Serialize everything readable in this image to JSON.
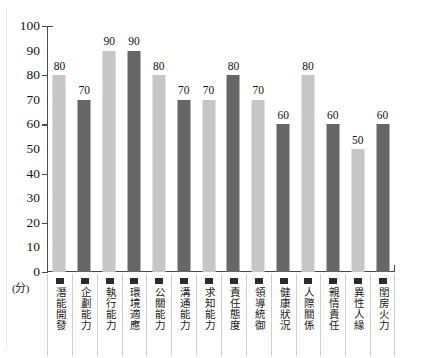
{
  "chart_data": {
    "type": "bar",
    "title": "",
    "xlabel": "",
    "ylabel": "(分)",
    "ylim": [
      0,
      100
    ],
    "ytick_step": 10,
    "yticks": [
      100,
      90,
      80,
      70,
      60,
      50,
      40,
      30,
      20,
      10,
      0
    ],
    "grid": false,
    "legend": "none",
    "categories": [
      "潛能開發",
      "企劃能力",
      "執行能力",
      "環境適應",
      "公關能力",
      "溝通能力",
      "求知能力",
      "責任態度",
      "領導統御",
      "健康狀況",
      "人際關係",
      "親情責任",
      "異性人緣",
      "閨房火力"
    ],
    "values": [
      80,
      70,
      90,
      90,
      80,
      70,
      70,
      80,
      70,
      60,
      80,
      60,
      50,
      60
    ],
    "bar_colors": [
      "#c6c6c6",
      "#666666",
      "#c6c6c6",
      "#666666",
      "#c6c6c6",
      "#666666",
      "#c6c6c6",
      "#666666",
      "#c6c6c6",
      "#666666",
      "#c6c6c6",
      "#666666",
      "#c6c6c6",
      "#666666"
    ],
    "palette": {
      "light_bar": "#c6c6c6",
      "dark_bar": "#666666",
      "axis": "#4a4a4a",
      "marker": "#2b2b2b",
      "cell_border": "#cfcfcf",
      "background": "#ffffff"
    }
  }
}
